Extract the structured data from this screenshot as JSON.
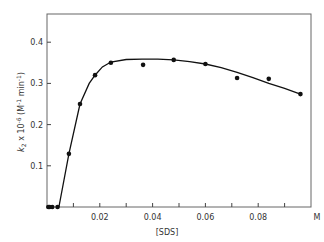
{
  "chart_data": {
    "type": "scatter",
    "title": "",
    "xlabel": "[SDS]",
    "x_unit": "M",
    "ylabel": "k2 x 10^-6 (M^-1 min^-1)",
    "ylabel_parts": {
      "k": "k",
      "sub": "2",
      "rest": " x 10",
      "exp": "-6",
      "unit": " (M",
      "unit_exp": "-1",
      "unit2": " min",
      "unit2_exp": "-1",
      "close": ")"
    },
    "xlim": [
      0,
      0.1
    ],
    "ylim": [
      0,
      0.46
    ],
    "x_ticks": [
      0.01,
      0.02,
      0.03,
      0.04,
      0.05,
      0.06,
      0.07,
      0.08,
      0.09
    ],
    "x_tick_labels": [
      {
        "value": 0.02,
        "label": "0.02"
      },
      {
        "value": 0.04,
        "label": "0.04"
      },
      {
        "value": 0.06,
        "label": "0.06"
      },
      {
        "value": 0.08,
        "label": "0.08"
      },
      {
        "value": 0.1,
        "label": "M"
      }
    ],
    "y_tick_labels": [
      {
        "value": 0.1,
        "label": "0.1"
      },
      {
        "value": 0.2,
        "label": "0.2"
      },
      {
        "value": 0.3,
        "label": "0.3"
      },
      {
        "value": 0.4,
        "label": "0.4"
      }
    ],
    "grid": false,
    "legend": null,
    "series": [
      {
        "name": "observed",
        "style": "filled-circle-markers",
        "x": [
          0.0005,
          0.001,
          0.002,
          0.004,
          0.0083,
          0.0125,
          0.0182,
          0.0242,
          0.0364,
          0.048,
          0.06,
          0.072,
          0.084,
          0.096
        ],
        "y": [
          0.0,
          0.0,
          0.0,
          0.0,
          0.129,
          0.25,
          0.32,
          0.35,
          0.345,
          0.357,
          0.347,
          0.313,
          0.311,
          0.274
        ]
      },
      {
        "name": "fitted curve",
        "style": "line",
        "x": [
          0.0045,
          0.0083,
          0.0125,
          0.016,
          0.0182,
          0.021,
          0.0242,
          0.03,
          0.036,
          0.042,
          0.048,
          0.054,
          0.06,
          0.066,
          0.072,
          0.078,
          0.084,
          0.09,
          0.096
        ],
        "y": [
          0.0,
          0.129,
          0.25,
          0.3,
          0.32,
          0.34,
          0.352,
          0.358,
          0.359,
          0.359,
          0.357,
          0.353,
          0.347,
          0.338,
          0.327,
          0.314,
          0.3,
          0.288,
          0.274
        ]
      }
    ]
  }
}
